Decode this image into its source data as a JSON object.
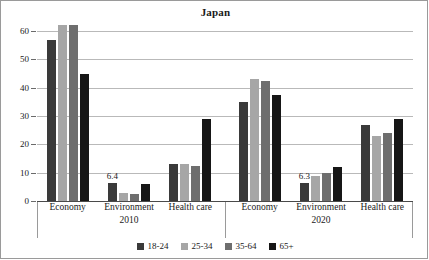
{
  "chart_data": {
    "type": "bar",
    "title": "Japan",
    "xlabel": "",
    "ylabel": "%",
    "ylim": [
      0,
      60
    ],
    "yticks": [
      0,
      10,
      20,
      30,
      40,
      50,
      60
    ],
    "grid": true,
    "legend_position": "bottom",
    "categories": [
      "Economy",
      "Environment",
      "Health care",
      "Economy",
      "Environment",
      "Health care"
    ],
    "supercategories": [
      "2010",
      "2020"
    ],
    "series": [
      {
        "name": "18-24",
        "color": "#3a3a3a",
        "values": [
          57,
          6.4,
          13,
          35,
          6.3,
          27
        ]
      },
      {
        "name": "25-34",
        "color": "#a6a6a6",
        "values": [
          62,
          3,
          13,
          43,
          9,
          23
        ]
      },
      {
        "name": "35-64",
        "color": "#6e6e6e",
        "values": [
          62,
          2.5,
          12.5,
          42.5,
          10,
          24
        ]
      },
      {
        "name": "65+",
        "color": "#161616",
        "values": [
          45,
          6,
          29,
          37.5,
          12,
          29
        ]
      }
    ],
    "annotations": [
      {
        "text": "6.4",
        "category": "Environment",
        "supercategory": "2010",
        "series": "18-24"
      },
      {
        "text": "6.3",
        "category": "Environment",
        "supercategory": "2020",
        "series": "18-24"
      }
    ]
  },
  "axis": {
    "y_tick_labels": [
      "60",
      "50",
      "40",
      "30",
      "20",
      "10",
      "0"
    ],
    "y_unit_label": "%"
  },
  "legend": {
    "items": [
      {
        "label": "18-24",
        "color": "#3a3a3a"
      },
      {
        "label": "25-34",
        "color": "#a6a6a6"
      },
      {
        "label": "35-64",
        "color": "#6e6e6e"
      },
      {
        "label": "65+",
        "color": "#161616"
      }
    ]
  }
}
